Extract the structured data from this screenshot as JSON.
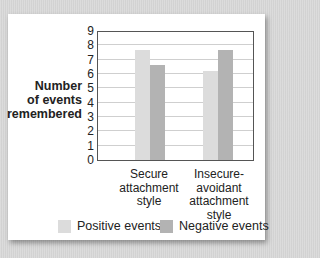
{
  "chart_data": {
    "type": "bar",
    "title": "",
    "xlabel": "",
    "ylabel": "Number of events remembered",
    "ylim": [
      0,
      9
    ],
    "yticks": [
      0,
      1,
      2,
      3,
      4,
      5,
      6,
      7,
      8,
      9
    ],
    "grid": true,
    "legend_position": "bottom",
    "categories": [
      "Secure attachment style",
      "Insecure-avoidant attachment style"
    ],
    "series": [
      {
        "name": "Positive events",
        "color": "#dcdcdc",
        "values": [
          7.7,
          6.2
        ]
      },
      {
        "name": "Negative events",
        "color": "#b3b3b3",
        "values": [
          6.6,
          7.7
        ]
      }
    ]
  },
  "labels": {
    "ylabel_lines": [
      "Number",
      "of events",
      "remembered"
    ],
    "cat0_lines": [
      "Secure",
      "attachment",
      "style"
    ],
    "cat1_lines": [
      "Insecure-",
      "avoidant",
      "attachment",
      "style"
    ],
    "legend_positive": "Positive events",
    "legend_negative": "Negative events"
  }
}
